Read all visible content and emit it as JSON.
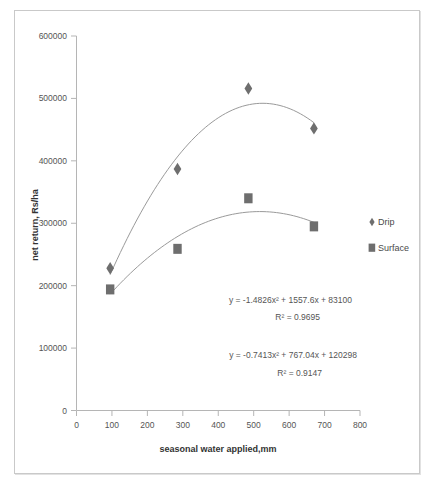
{
  "chart_data": {
    "type": "scatter",
    "title": "",
    "xlabel": "seasonal water applied,mm",
    "ylabel": "net return, Rs/ha",
    "xlim": [
      0,
      800
    ],
    "ylim": [
      0,
      600000
    ],
    "xticks": [
      "0",
      "100",
      "200",
      "300",
      "400",
      "500",
      "600",
      "700",
      "800"
    ],
    "yticks": [
      "0",
      "100000",
      "200000",
      "300000",
      "400000",
      "500000",
      "600000"
    ],
    "grid": false,
    "legend_position": "right",
    "x": [
      95,
      285,
      485,
      670
    ],
    "series": [
      {
        "name": "Drip",
        "marker": "diamond",
        "color": "#6e6e6e",
        "values": [
          228000,
          387000,
          516000,
          452000
        ],
        "equation": "y = -1.4826x² + 1557.6x + 83100",
        "equation_plain": "y = -1.4826x2 + 1557.6x + 83100",
        "r2": "R² = 0.9695",
        "coefficients": {
          "a": -1.4826,
          "b": 1557.6,
          "c": 83100,
          "r2": 0.9695
        }
      },
      {
        "name": "Surface",
        "marker": "square",
        "color": "#6e6e6e",
        "values": [
          194000,
          259000,
          340000,
          295000
        ],
        "equation": "y = -0.7413x² + 767.04x + 120298",
        "equation_plain": "y = -0.7413x2 + 767.04x + 120298",
        "r2": "R² = 0.9147",
        "coefficients": {
          "a": -0.7413,
          "b": 767.04,
          "c": 120298,
          "r2": 0.9147
        }
      }
    ],
    "annotations": [
      {
        "id": "eq-drip",
        "line1": "y = -1.4826x² + 1557.6x + 83100",
        "line2": "R² = 0.9695"
      },
      {
        "id": "eq-surface",
        "line1": "y = -0.7413x² + 767.04x + 120298",
        "line2": "R² = 0.9147"
      }
    ]
  },
  "axes": {
    "x_title": "seasonal water applied,mm",
    "y_title": "net return, Rs/ha",
    "x_ticks": [
      "0",
      "100",
      "200",
      "300",
      "400",
      "500",
      "600",
      "700",
      "800"
    ],
    "y_ticks": [
      "0",
      "100000",
      "200000",
      "300000",
      "400000",
      "500000",
      "600000"
    ]
  },
  "legend": {
    "items": [
      {
        "label": "Drip",
        "marker": "diamond"
      },
      {
        "label": "Surface",
        "marker": "square"
      }
    ]
  },
  "equations": {
    "drip_line1": "y = -1.4826x² + 1557.6x + 83100",
    "drip_line2": "R² = 0.9695",
    "surface_line1": "y = -0.7413x² + 767.04x + 120298",
    "surface_line2": "R² = 0.9147"
  },
  "colors": {
    "marker": "#6e6e6e",
    "trend": "#9a9a9a",
    "axis": "#b5b5b5",
    "text": "#555555",
    "border": "#c9c9c9"
  }
}
